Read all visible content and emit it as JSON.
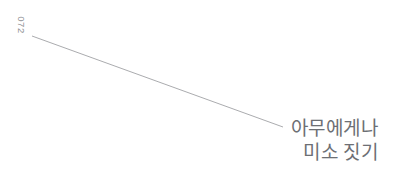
{
  "page": {
    "background_color": "#ffffff",
    "width": 393,
    "height": 188
  },
  "folio": {
    "label": "072",
    "color": "#8f9094",
    "rotation_degrees": 90
  },
  "leader_line": {
    "color": "#9b9c9f",
    "x1": 32,
    "y1": 36,
    "x2": 283,
    "y2": 127
  },
  "caption": {
    "color": "#6d6f74",
    "align": "right",
    "lines": [
      {
        "text": "아무에게나"
      },
      {
        "text": "미소 짓기"
      }
    ]
  }
}
